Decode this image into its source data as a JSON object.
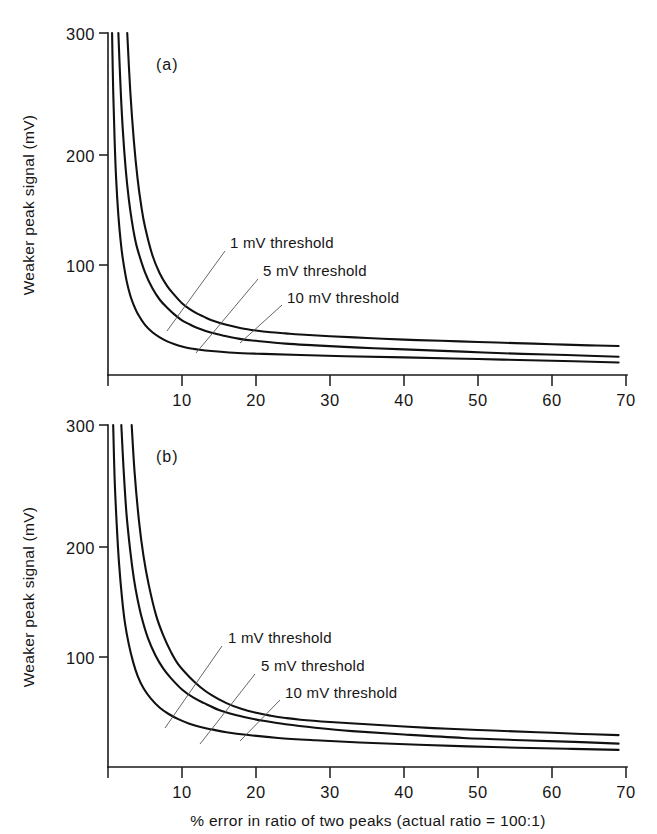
{
  "figure": {
    "background": "#ffffff",
    "ink_color": "#111111",
    "leader_color": "#555555"
  },
  "chart_data": [
    {
      "type": "line",
      "panel_label": "(a)",
      "title": "",
      "xlabel": "",
      "ylabel": "Weaker peak signal (mV)",
      "xlim": [
        0,
        70
      ],
      "ylim": [
        0,
        300
      ],
      "xticks": [
        10,
        20,
        30,
        40,
        50,
        60,
        70
      ],
      "xticklabels": [
        "10",
        "20",
        "30",
        "40",
        "50",
        "60",
        "70"
      ],
      "yticks": [
        100,
        200,
        300
      ],
      "yticklabels": [
        "100",
        "200",
        "300"
      ],
      "grid": false,
      "legend_position": "inline-annotations",
      "annotations": [
        {
          "text": "1 mV threshold",
          "series": "1 mV threshold"
        },
        {
          "text": "5 mV threshold",
          "series": "5 mV threshold"
        },
        {
          "text": "10 mV threshold",
          "series": "10 mV threshold"
        }
      ],
      "series": [
        {
          "name": "10 mV threshold",
          "x": [
            2.6,
            3.0,
            3.5,
            4.0,
            4.5,
            5.0,
            6.0,
            7.0,
            8.0,
            9.0,
            10.0,
            11.0,
            12.0,
            13.0,
            14.0,
            16.0,
            18.0,
            20.0,
            22.0,
            24.0,
            26.0,
            30.0,
            35.0,
            40.0,
            45.0,
            50.0,
            55.0,
            60.0,
            65.0,
            69.0
          ],
          "y": [
            300,
            250,
            205,
            172,
            148,
            130,
            105,
            89,
            78,
            70,
            63,
            58,
            54,
            51,
            48,
            44,
            41,
            39,
            37.5,
            36.5,
            35.5,
            34,
            32.5,
            31,
            30,
            29,
            28,
            27,
            26,
            25.5
          ]
        },
        {
          "name": "5 mV threshold",
          "x": [
            1.4,
            1.7,
            2.0,
            2.4,
            2.8,
            3.2,
            3.6,
            4.0,
            5.0,
            6.0,
            7.0,
            8.0,
            9.0,
            10.0,
            11.0,
            12.0,
            14.0,
            16.0,
            18.0,
            20.0,
            24.0,
            28.0,
            34.0,
            40.0,
            48.0,
            56.0,
            62.0,
            69.0
          ],
          "y": [
            300,
            252,
            215,
            180,
            155,
            136,
            121,
            110,
            90,
            76,
            66,
            59,
            53,
            48,
            44.5,
            41.5,
            37,
            34,
            31.5,
            30,
            27.5,
            26,
            24,
            22.5,
            20.5,
            18.5,
            17.5,
            16
          ]
        },
        {
          "name": "1 mV threshold",
          "x": [
            0.55,
            0.7,
            0.9,
            1.1,
            1.4,
            1.7,
            2.0,
            2.5,
            3.0,
            3.5,
            4.0,
            5.0,
            6.0,
            7.0,
            8.0,
            9.0,
            10.0,
            11.0,
            12.0,
            14.0,
            17.0,
            21.0,
            26.0,
            32.0,
            40.0,
            50.0,
            60.0,
            69.0
          ],
          "y": [
            300,
            250,
            205,
            172,
            140,
            118,
            102,
            83,
            70,
            61,
            54,
            44,
            37.5,
            33,
            29.5,
            27,
            25,
            23.5,
            22.5,
            21,
            19.5,
            18.5,
            17.5,
            16.5,
            15.5,
            14,
            12.5,
            11
          ]
        }
      ]
    },
    {
      "type": "line",
      "panel_label": "(b)",
      "title": "",
      "xlabel": "% error in ratio of two peaks (actual ratio = 100:1)",
      "ylabel": "Weaker peak signal (mV)",
      "xlim": [
        0,
        70
      ],
      "ylim": [
        0,
        300
      ],
      "xticks": [
        10,
        20,
        30,
        40,
        50,
        60,
        70
      ],
      "xticklabels": [
        "10",
        "20",
        "30",
        "40",
        "50",
        "60",
        "70"
      ],
      "yticks": [
        100,
        200,
        300
      ],
      "yticklabels": [
        "100",
        "200",
        "300"
      ],
      "grid": false,
      "legend_position": "inline-annotations",
      "annotations": [
        {
          "text": "1 mV threshold",
          "series": "1 mV threshold"
        },
        {
          "text": "5 mV threshold",
          "series": "5 mV threshold"
        },
        {
          "text": "10 mV threshold",
          "series": "10 mV threshold"
        }
      ],
      "series": [
        {
          "name": "10 mV threshold",
          "x": [
            3.2,
            3.6,
            4.2,
            4.8,
            5.5,
            6.5,
            7.5,
            8.5,
            9.5,
            11.0,
            12.5,
            14.0,
            16.0,
            18.0,
            20.0,
            22.0,
            24.0,
            26.0,
            30.0,
            35.0,
            40.0,
            46.0,
            52.0,
            58.0,
            64.0,
            69.0
          ],
          "y": [
            300,
            258,
            215,
            185,
            160,
            133,
            115,
            101,
            90,
            79,
            70,
            63,
            56,
            51,
            47.5,
            45,
            43,
            41.5,
            39.5,
            37.5,
            35.5,
            33.5,
            32,
            30.5,
            29,
            28
          ]
        },
        {
          "name": "5 mV threshold",
          "x": [
            1.8,
            2.1,
            2.5,
            3.0,
            3.5,
            4.0,
            4.6,
            5.4,
            6.4,
            7.5,
            8.5,
            10.0,
            11.5,
            13.0,
            15.0,
            17.0,
            19.0,
            21.0,
            24.0,
            28.0,
            33.0,
            40.0,
            48.0,
            56.0,
            63.0,
            69.0
          ],
          "y": [
            300,
            262,
            222,
            190,
            165,
            147,
            130,
            113,
            98,
            86,
            78,
            68,
            61,
            56,
            50,
            46,
            43,
            40.5,
            37.5,
            34.5,
            31.5,
            28.5,
            25.5,
            23.5,
            22,
            20.5
          ]
        },
        {
          "name": "1 mV threshold",
          "x": [
            0.7,
            0.9,
            1.2,
            1.5,
            1.9,
            2.3,
            2.8,
            3.4,
            4.0,
            4.8,
            5.8,
            7.0,
            8.2,
            9.5,
            11.0,
            12.5,
            14.0,
            16.0,
            19.0,
            23.0,
            28.0,
            34.0,
            42.0,
            52.0,
            62.0,
            69.0
          ],
          "y": [
            300,
            252,
            210,
            178,
            148,
            126,
            108,
            92,
            80,
            69,
            60,
            52,
            46.5,
            42,
            38,
            35,
            33,
            30.5,
            28,
            25.5,
            23.5,
            21.5,
            19.5,
            17.5,
            16,
            15
          ]
        }
      ]
    }
  ]
}
